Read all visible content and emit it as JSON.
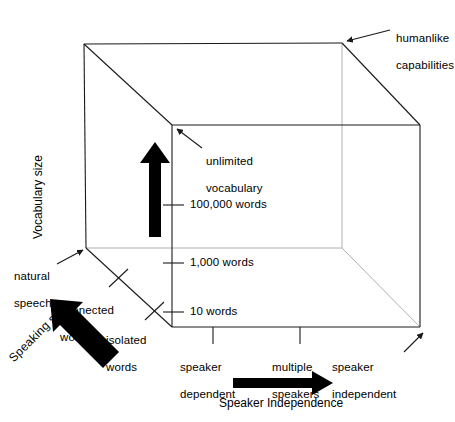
{
  "figure": {
    "type": "conceptual-cube-diagram",
    "background_color": "#ffffff",
    "line_color": "#000000",
    "line_color_hidden": "#aaaaaa",
    "arrow_color": "#000000"
  },
  "axes": {
    "vertical": {
      "name": "Vocabulary size",
      "title": "Vocabulary size",
      "ticks": [
        {
          "label": "10 words",
          "position": 0.0
        },
        {
          "label": "1,000 words",
          "position": 0.42
        },
        {
          "label": "100,000 words",
          "position": 0.77
        }
      ],
      "top_annotation": "unlimited\nvocabulary",
      "top_annotation_line1": "unlimited",
      "top_annotation_line2": "vocabulary"
    },
    "horizontal": {
      "name": "Speaker Independence",
      "title": "Speaker Independence",
      "ticks": [
        {
          "label_line1": "speaker",
          "label_line2": "dependent"
        },
        {
          "label_line1": "multiple",
          "label_line2": "speakers"
        },
        {
          "label_line1": "speaker",
          "label_line2": "independent"
        }
      ]
    },
    "depth": {
      "name": "Speaking style",
      "title": "Speaking style",
      "ticks": [
        {
          "label_line1": "isolated",
          "label_line2": "words"
        },
        {
          "label_line1": "connected",
          "label_line2": "words"
        },
        {
          "label_line1": "natural",
          "label_line2": "speech"
        }
      ]
    }
  },
  "annotations": {
    "corner_far": {
      "line1": "humanlike",
      "line2": "capabilities"
    }
  }
}
